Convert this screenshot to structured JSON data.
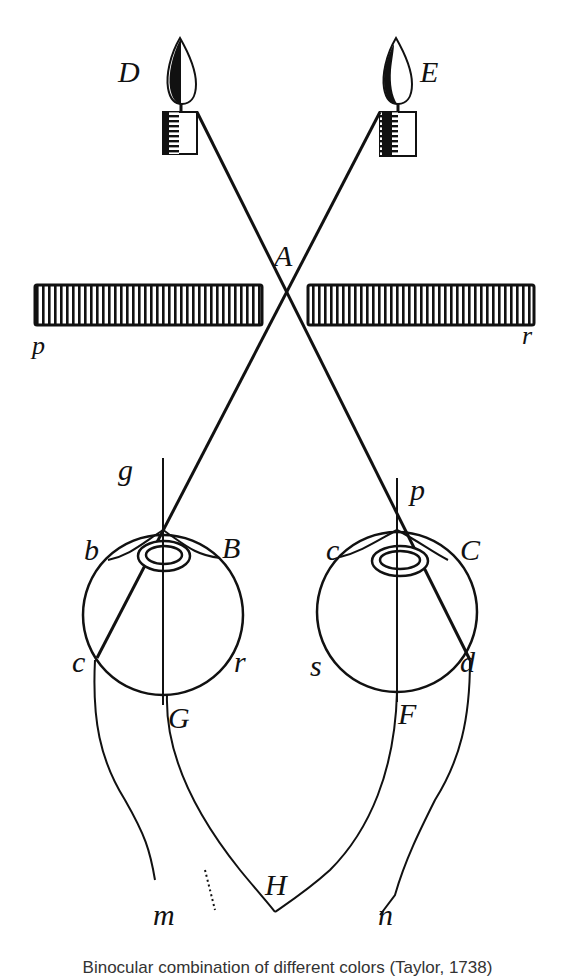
{
  "figure": {
    "labels": {
      "D": "D",
      "E": "E",
      "A": "A",
      "screen_left": "p",
      "screen_right": "r",
      "g": "g",
      "p_right": "p",
      "b": "b",
      "B": "B",
      "c_left": "c",
      "r": "r",
      "G": "G",
      "c_right": "c",
      "C": "C",
      "s": "s",
      "d": "d",
      "F": "F",
      "H": "H",
      "m": "m",
      "n": "n"
    },
    "caption": "Binocular combination of different colors (Taylor, 1738)"
  },
  "colors": {
    "ink": "#111111",
    "paper": "#ffffff"
  }
}
